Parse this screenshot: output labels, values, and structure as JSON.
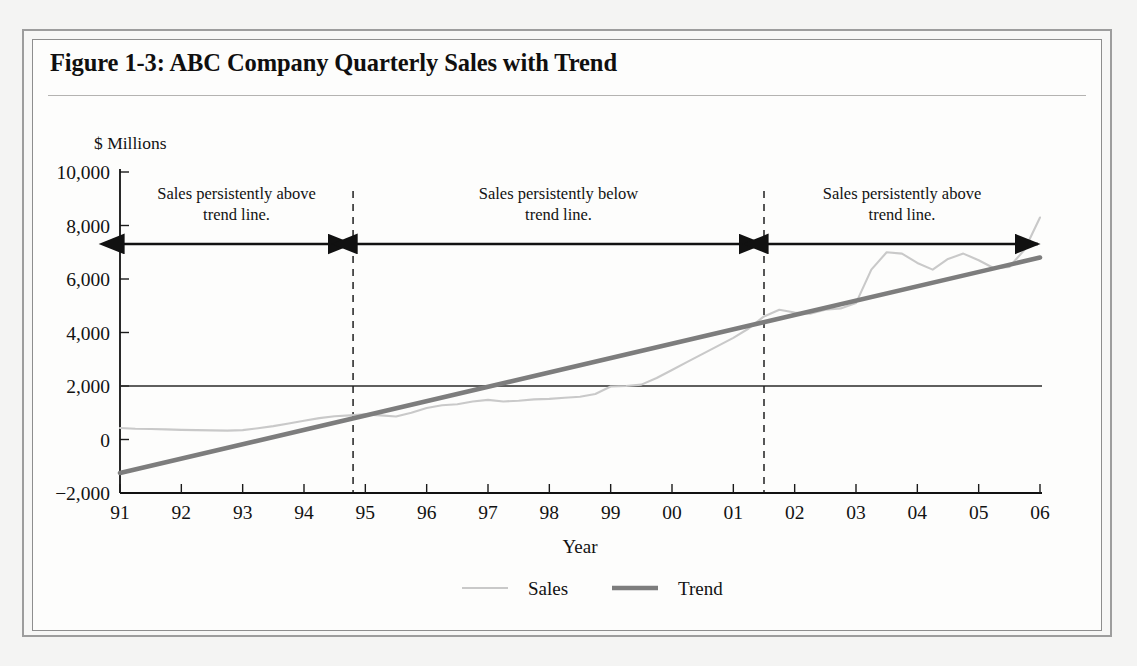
{
  "figure": {
    "title": "Figure 1-3: ABC Company Quarterly Sales with Trend"
  },
  "chart_data": {
    "type": "line",
    "title": "Figure 1-3: ABC Company Quarterly Sales with Trend",
    "unit_label": "$ Millions",
    "xlabel": "Year",
    "ylabel": "",
    "grid": false,
    "legend_position": "bottom",
    "xlim": [
      1991,
      2006
    ],
    "ylim": [
      -2000,
      10000
    ],
    "ytick_labels": [
      "10,000",
      "8,000",
      "6,000",
      "4,000",
      "2,000",
      "0",
      "-2,000"
    ],
    "ytick_values": [
      10000,
      8000,
      6000,
      4000,
      2000,
      0,
      -2000
    ],
    "xtick_labels": [
      "91",
      "92",
      "93",
      "94",
      "95",
      "96",
      "97",
      "98",
      "99",
      "00",
      "01",
      "02",
      "03",
      "04",
      "05",
      "06"
    ],
    "xtick_values": [
      1991,
      1992,
      1993,
      1994,
      1995,
      1996,
      1997,
      1998,
      1999,
      2000,
      2001,
      2002,
      2003,
      2004,
      2005,
      2006
    ],
    "reference_line_y": 2000,
    "series": [
      {
        "name": "Sales",
        "color": "#c9c9c9",
        "x": [
          1991.0,
          1991.25,
          1991.5,
          1991.75,
          1992.0,
          1992.25,
          1992.5,
          1992.75,
          1993.0,
          1993.25,
          1993.5,
          1993.75,
          1994.0,
          1994.25,
          1994.5,
          1994.75,
          1995.0,
          1995.25,
          1995.5,
          1995.75,
          1996.0,
          1996.25,
          1996.5,
          1996.75,
          1997.0,
          1997.25,
          1997.5,
          1997.75,
          1998.0,
          1998.25,
          1998.5,
          1998.75,
          1999.0,
          1999.25,
          1999.5,
          1999.75,
          2000.0,
          2000.25,
          2000.5,
          2000.75,
          2001.0,
          2001.25,
          2001.5,
          2001.75,
          2002.0,
          2002.25,
          2002.5,
          2002.75,
          2003.0,
          2003.25,
          2003.5,
          2003.75,
          2004.0,
          2004.25,
          2004.5,
          2004.75,
          2005.0,
          2005.25,
          2005.5,
          2005.75,
          2006.0
        ],
        "values": [
          430,
          400,
          390,
          380,
          360,
          350,
          340,
          330,
          350,
          420,
          500,
          600,
          700,
          800,
          870,
          900,
          940,
          900,
          860,
          1000,
          1180,
          1280,
          1320,
          1420,
          1480,
          1420,
          1450,
          1500,
          1520,
          1560,
          1600,
          1700,
          1980,
          2000,
          2050,
          2300,
          2600,
          2900,
          3200,
          3500,
          3800,
          4150,
          4600,
          4850,
          4750,
          4700,
          4850,
          4900,
          5100,
          6350,
          7000,
          6950,
          6600,
          6350,
          6750,
          6950,
          6700,
          6400,
          6450,
          7100,
          8300
        ],
        "annotated_points": {
          "start_1991": 430,
          "low_1992": 330,
          "mid_1997": 1450,
          "crossing_1999": 2000,
          "peak_2003": 7000,
          "dip_2004": 6350,
          "peak_2005": 8300,
          "end_2006": 8700
        }
      },
      {
        "name": "Trend",
        "color": "#7d7d7d",
        "x": [
          1991,
          2006
        ],
        "values": [
          -1250,
          6800
        ]
      }
    ],
    "annotations": [
      {
        "lines": [
          "Sales persistently above",
          "trend line."
        ],
        "x_start": 1991,
        "x_end": 1994.8,
        "arrow": "double"
      },
      {
        "lines": [
          "Sales persistently below",
          "trend line."
        ],
        "x_start": 1994.8,
        "x_end": 2001.5,
        "arrow": "double"
      },
      {
        "lines": [
          "Sales persistently above",
          "trend line."
        ],
        "x_start": 2001.5,
        "x_end": 2006,
        "arrow": "double"
      }
    ],
    "divider_lines_x": [
      1994.8,
      2001.5
    ],
    "legend": [
      {
        "label": "Sales",
        "color": "#c9c9c9"
      },
      {
        "label": "Trend",
        "color": "#7d7d7d"
      }
    ]
  }
}
